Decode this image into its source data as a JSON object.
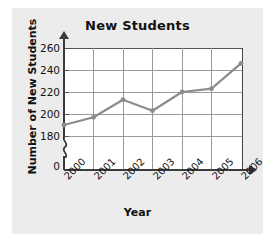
{
  "chart_data": {
    "type": "line",
    "title": "New Students",
    "xlabel": "Year",
    "ylabel": "Number of New Students",
    "categories": [
      "2000",
      "2001",
      "2002",
      "2003",
      "2004",
      "2005",
      "2006"
    ],
    "values": [
      190,
      197,
      213,
      203,
      220,
      223,
      246
    ],
    "series": [
      {
        "name": "New Students",
        "values": [
          190,
          197,
          213,
          203,
          220,
          223,
          246
        ]
      }
    ],
    "ytick_labels": [
      "0",
      "180",
      "200",
      "220",
      "240",
      "260"
    ],
    "ylim": [
      180,
      260
    ],
    "y_axis_break": true,
    "y_axis_break_symbol": "zigzag",
    "grid": true,
    "legend": "none",
    "line_color": "#8c8c8c",
    "marker": "circle",
    "marker_color": "#8c8c8c",
    "plot_background": "#ffffff",
    "figure_background": "#ececed",
    "text_color": "#111111",
    "grid_color": "#9a9a9a"
  },
  "axis": {
    "y_ticks": [
      {
        "label": "260",
        "value": 260
      },
      {
        "label": "240",
        "value": 240
      },
      {
        "label": "220",
        "value": 220
      },
      {
        "label": "200",
        "value": 200
      },
      {
        "label": "180",
        "value": 180
      },
      {
        "label": "0",
        "value": 0
      }
    ],
    "x_ticks": [
      {
        "label": "2000"
      },
      {
        "label": "2001"
      },
      {
        "label": "2002"
      },
      {
        "label": "2003"
      },
      {
        "label": "2004"
      },
      {
        "label": "2005"
      },
      {
        "label": "2006"
      }
    ]
  }
}
